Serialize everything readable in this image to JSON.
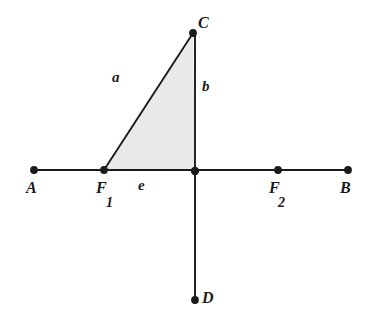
{
  "figure": {
    "type": "geometry-diagram",
    "background_color": "#ffffff",
    "stroke_color": "#1a1a1a",
    "fill_color": "#e9e9e9",
    "width": 372,
    "height": 327
  },
  "points": [
    {
      "id": "A",
      "label": "A",
      "x": 34,
      "y": 170,
      "label_x": 26,
      "label_y": 180,
      "dot": true
    },
    {
      "id": "F1",
      "label": "F",
      "subscript": "1",
      "x": 104,
      "y": 170,
      "label_x": 96,
      "label_y": 180,
      "sub_x": 106,
      "sub_y": 196,
      "dot": true
    },
    {
      "id": "O",
      "label": "",
      "x": 195,
      "y": 171,
      "dot": true
    },
    {
      "id": "F2",
      "label": "F",
      "subscript": "2",
      "x": 278,
      "y": 170,
      "label_x": 269,
      "label_y": 180,
      "sub_x": 278,
      "sub_y": 196,
      "dot": true
    },
    {
      "id": "B",
      "label": "B",
      "x": 348,
      "y": 170,
      "label_x": 340,
      "label_y": 180,
      "dot": true
    },
    {
      "id": "C",
      "label": "C",
      "x": 193,
      "y": 33,
      "label_x": 198,
      "label_y": 15,
      "dot": true
    },
    {
      "id": "D",
      "label": "D",
      "x": 195,
      "y": 300,
      "label_x": 202,
      "label_y": 290,
      "dot": true
    }
  ],
  "segments": [
    {
      "id": "horizontal-axis",
      "from": "A",
      "to": "B",
      "x1": 34,
      "y1": 170,
      "x2": 348,
      "y2": 170
    },
    {
      "id": "vertical-axis",
      "from": "C",
      "to": "D",
      "x1": 195,
      "y1": 33,
      "x2": 195,
      "y2": 300
    }
  ],
  "triangle": {
    "id": "shaded-triangle",
    "vertices": [
      "F1",
      "C",
      "O"
    ],
    "polygon": "104,170 193,33 195,171",
    "fill": "#e9e9e9",
    "sides": [
      {
        "id": "side-a",
        "label": "a",
        "between": [
          "F1",
          "C"
        ],
        "label_x": 112,
        "label_y": 70
      },
      {
        "id": "side-b",
        "label": "b",
        "between": [
          "C",
          "O"
        ],
        "label_x": 202,
        "label_y": 79
      },
      {
        "id": "side-e",
        "label": "e",
        "between": [
          "F1",
          "O"
        ],
        "label_x": 138,
        "label_y": 178
      }
    ]
  }
}
